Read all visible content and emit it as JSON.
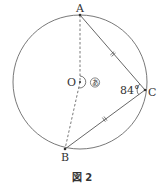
{
  "diagram": {
    "points": {
      "A": "A",
      "B": "B",
      "C": "C",
      "O": "O"
    },
    "angle_C_label": "84°",
    "unknown_angle_label": "あ",
    "caption": "図 2",
    "colors": {
      "stroke": "#555555",
      "text": "#333333"
    },
    "relations": {
      "equal_chords": [
        "AC",
        "BC"
      ],
      "dashed_segments": [
        "OA",
        "OB"
      ],
      "angle_ACB_degrees": 84
    }
  }
}
